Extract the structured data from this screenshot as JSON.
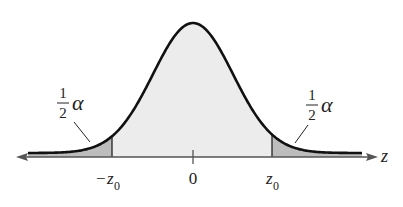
{
  "diagram": {
    "axis_label": "z",
    "ticks": [
      {
        "label_sign": "−",
        "label_var": "z",
        "label_sub": "0",
        "role": "negative-critical-value"
      },
      {
        "label_sign": "",
        "label_var": "0",
        "label_sub": "",
        "role": "center"
      },
      {
        "label_sign": "",
        "label_var": "z",
        "label_sub": "0",
        "role": "positive-critical-value"
      }
    ],
    "tail_labels": {
      "left": {
        "numerator": "1",
        "denominator": "2",
        "symbol": "α"
      },
      "right": {
        "numerator": "1",
        "denominator": "2",
        "symbol": "α"
      }
    },
    "colors": {
      "curve": "#111111",
      "body_fill": "#ececec",
      "tail_fill": "#bdbdbd",
      "axis": "#555555"
    }
  }
}
